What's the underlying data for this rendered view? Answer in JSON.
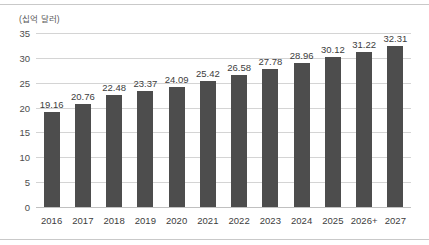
{
  "chart_data": {
    "type": "bar",
    "title": "",
    "subtitle": "",
    "xlabel": "",
    "ylabel": "(십억 달러)",
    "unit_caption": "(십억 달러)",
    "categories": [
      "2016",
      "2017",
      "2018",
      "2019",
      "2020",
      "2021",
      "2022",
      "2023",
      "2024",
      "2025",
      "2026+",
      "2027"
    ],
    "values": [
      19.16,
      20.76,
      22.48,
      23.37,
      24.09,
      25.42,
      26.58,
      27.78,
      28.96,
      30.12,
      31.22,
      32.31
    ],
    "data_labels": [
      "19.16",
      "20.76",
      "22.48",
      "23.37",
      "24.09",
      "25.42",
      "26.58",
      "27.78",
      "28.96",
      "30.12",
      "31.22",
      "32.31"
    ],
    "ylim": [
      0,
      35
    ],
    "yticks": [
      0,
      5,
      10,
      15,
      20,
      25,
      30,
      35
    ],
    "ytick_labels": [
      "0",
      "5",
      "10",
      "15",
      "20",
      "25",
      "30",
      "35"
    ],
    "grid": true,
    "grid_axis": "y",
    "legend": false,
    "legend_position": "none",
    "series": [
      {
        "name": "",
        "values": [
          19.16,
          20.76,
          22.48,
          23.37,
          24.09,
          25.42,
          26.58,
          27.78,
          28.96,
          30.12,
          31.22,
          32.31
        ]
      }
    ],
    "colors": {
      "bar": "#4d4d4d",
      "grid": "#d4d4d4",
      "baseline": "#c0c0c0",
      "frame_rule": "#c9c9c9",
      "tick_text": "#3d3d3d",
      "caption_text": "#5a5a5a",
      "background": "#ffffff"
    }
  }
}
